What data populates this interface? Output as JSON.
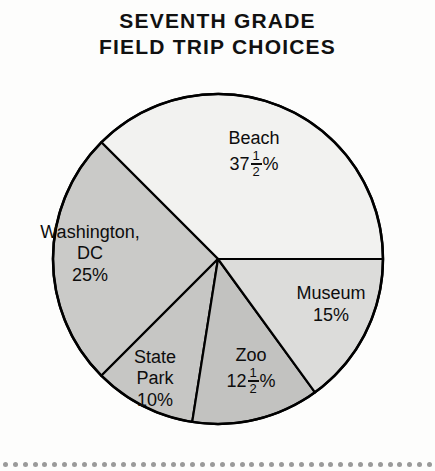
{
  "title": {
    "line1": "SEVENTH GRADE",
    "line2": "FIELD TRIP CHOICES"
  },
  "chart_data": {
    "type": "pie",
    "title": "SEVENTH GRADE FIELD TRIP CHOICES",
    "units": "percent",
    "total": 100,
    "start_angle_deg": 0,
    "direction": "counterclockwise",
    "legend": "none (labels inside slices)",
    "categories": [
      "Beach",
      "Washington, DC",
      "State Park",
      "Zoo",
      "Museum"
    ],
    "values": [
      37.5,
      25,
      10,
      12.5,
      15
    ],
    "value_labels": [
      "37 1/2 %",
      "25%",
      "10%",
      "12 1/2 %",
      "15%"
    ],
    "slices": [
      {
        "name": "Beach",
        "label_lines": [
          "Beach"
        ],
        "value": 37.5,
        "value_text": "37½%",
        "whole": "37",
        "numerator": "1",
        "denominator": "2",
        "percent_sign": "%",
        "has_fraction": true,
        "angle_deg": 135,
        "start_deg": 0,
        "end_deg": 135,
        "color": "#f2f2f0"
      },
      {
        "name": "Washington, DC",
        "label_lines": [
          "Washington,",
          "DC"
        ],
        "value": 25,
        "value_text": "25%",
        "has_fraction": false,
        "angle_deg": 90,
        "start_deg": 135,
        "end_deg": 225,
        "color": "#cacac8"
      },
      {
        "name": "State Park",
        "label_lines": [
          "State",
          "Park"
        ],
        "value": 10,
        "value_text": "10%",
        "has_fraction": false,
        "angle_deg": 36,
        "start_deg": 225,
        "end_deg": 261,
        "color": "#c6c6c4"
      },
      {
        "name": "Zoo",
        "label_lines": [
          "Zoo"
        ],
        "value": 12.5,
        "value_text": "12½%",
        "whole": "12",
        "numerator": "1",
        "denominator": "2",
        "percent_sign": "%",
        "has_fraction": true,
        "angle_deg": 45,
        "start_deg": 261,
        "end_deg": 306,
        "color": "#c2c2c0"
      },
      {
        "name": "Museum",
        "label_lines": [
          "Museum"
        ],
        "value": 15,
        "value_text": "15%",
        "has_fraction": false,
        "angle_deg": 54,
        "start_deg": 306,
        "end_deg": 360,
        "color": "#dcdcda"
      }
    ],
    "geometry": {
      "center_x": 218,
      "center_y": 259,
      "radius": 165
    },
    "outline_color": "#000000"
  },
  "labels": {
    "beach": {
      "name": "Beach",
      "whole": "37",
      "num": "1",
      "den": "2",
      "pct": "%"
    },
    "washington": {
      "line1": "Washington,",
      "line2": "DC",
      "value": "25%"
    },
    "museum": {
      "name": "Museum",
      "value": "15%"
    },
    "statepark": {
      "line1": "State",
      "line2": "Park",
      "value": "10%"
    },
    "zoo": {
      "name": "Zoo",
      "whole": "12",
      "num": "1",
      "den": "2",
      "pct": "%"
    }
  },
  "decoration": {
    "dot_count": 44,
    "dot_color": "#9a9a9a"
  }
}
